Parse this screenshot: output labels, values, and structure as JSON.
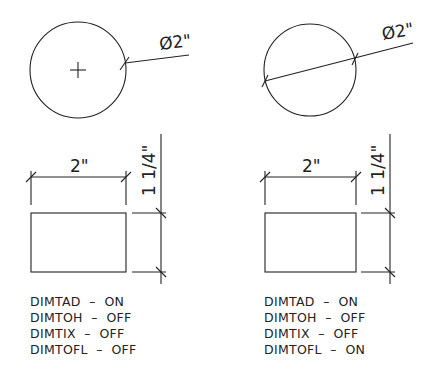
{
  "figure": {
    "panels": [
      {
        "id": "left",
        "circle_dimension": {
          "label": "Ø2\"",
          "type": "diameter-leader-outside"
        },
        "rect_horizontal_dimension": {
          "label": "2\""
        },
        "rect_vertical_dimension": {
          "label": "1 1/4\""
        },
        "settings": [
          {
            "name": "DIMTAD",
            "value": "ON",
            "line": "DIMTAD  –  ON"
          },
          {
            "name": "DIMTOH",
            "value": "OFF",
            "line": "DIMTOH  –  OFF"
          },
          {
            "name": "DIMTIX",
            "value": "OFF",
            "line": "DIMTIX  –  OFF"
          },
          {
            "name": "DIMTOFL",
            "value": "OFF",
            "line": "DIMTOFL  –  OFF"
          }
        ]
      },
      {
        "id": "right",
        "circle_dimension": {
          "label": "Ø2\"",
          "type": "diameter-line-through-circle"
        },
        "rect_horizontal_dimension": {
          "label": "2\""
        },
        "rect_vertical_dimension": {
          "label": "1 1/4\""
        },
        "settings": [
          {
            "name": "DIMTAD",
            "value": "ON",
            "line": "DIMTAD  –  ON"
          },
          {
            "name": "DIMTOH",
            "value": "OFF",
            "line": "DIMTOH  –  OFF"
          },
          {
            "name": "DIMTIX",
            "value": "OFF",
            "line": "DIMTIX  –  OFF"
          },
          {
            "name": "DIMTOFL",
            "value": "ON",
            "line": "DIMTOFL  –  ON"
          }
        ]
      }
    ],
    "colors": {
      "line": "#222222",
      "background": "#ffffff"
    }
  }
}
